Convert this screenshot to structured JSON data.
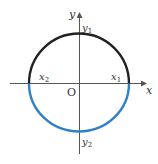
{
  "diagram": {
    "type": "unit-circle-halves",
    "colors": {
      "axis": "#555555",
      "upper_arc": "#222222",
      "lower_arc": "#2f80c8",
      "text": "#333333"
    },
    "geometry": {
      "center": [
        79,
        83
      ],
      "radius": 50,
      "x_axis": {
        "from": 10,
        "to": 146
      },
      "y_axis": {
        "from": 154,
        "to": 12
      }
    },
    "labels": {
      "x_axis": "x",
      "y_axis": "y",
      "origin": "O",
      "x1": {
        "base": "x",
        "sub": "1"
      },
      "x2": {
        "base": "x",
        "sub": "2"
      },
      "y1": {
        "base": "y",
        "sub": "1"
      },
      "y2": {
        "base": "y",
        "sub": "2"
      }
    }
  }
}
